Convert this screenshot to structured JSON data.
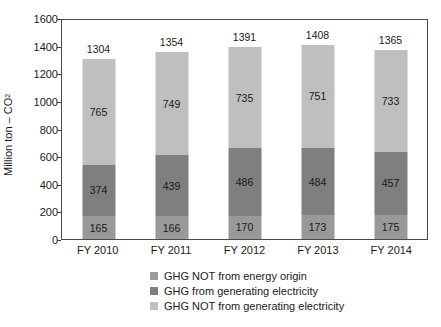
{
  "chart_data": {
    "type": "bar",
    "subtype": "stacked-bar",
    "title": "",
    "xlabel": "",
    "ylabel": "Million ton – CO2",
    "ylabel_prefix": "Million ton – CO",
    "ylabel_sub": "2",
    "ylim": [
      0,
      1600
    ],
    "ytick_step": 200,
    "yticks": [
      0,
      200,
      400,
      600,
      800,
      1000,
      1200,
      1400,
      1600
    ],
    "grid": false,
    "legend_position": "bottom",
    "categories": [
      "FY 2010",
      "FY 2011",
      "FY 2012",
      "FY 2013",
      "FY 2014"
    ],
    "series": [
      {
        "name": "GHG NOT from energy origin",
        "color": "#999999",
        "values": [
          165,
          166,
          170,
          173,
          175
        ]
      },
      {
        "name": "GHG from generating electricity",
        "color": "#7f7f7f",
        "values": [
          374,
          439,
          486,
          484,
          457
        ]
      },
      {
        "name": "GHG NOT from generating electricity",
        "color": "#bfbfbf",
        "values": [
          765,
          749,
          735,
          751,
          733
        ]
      }
    ],
    "totals": [
      1304,
      1354,
      1391,
      1408,
      1365
    ]
  },
  "axis": {
    "tick_labels": [
      "1600",
      "1400",
      "1200",
      "1000",
      "800",
      "600",
      "400",
      "200",
      "0"
    ]
  },
  "legend": {
    "items": [
      {
        "label": "GHG NOT from energy origin",
        "color": "#999999"
      },
      {
        "label": "GHG from generating electricity",
        "color": "#7f7f7f"
      },
      {
        "label": "GHG NOT from generating electricity",
        "color": "#bfbfbf"
      }
    ]
  }
}
